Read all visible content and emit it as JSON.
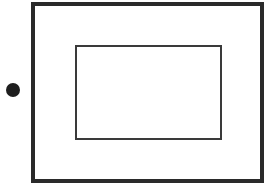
{
  "diagram": {
    "shapes": [
      {
        "type": "rectangle",
        "role": "outer-frame",
        "stroke": "thick",
        "color": "#2a2a2a"
      },
      {
        "type": "rectangle",
        "role": "inner-frame",
        "stroke": "thin",
        "color": "#3a3a3a"
      },
      {
        "type": "circle",
        "role": "marker-dot",
        "fill": "#1e1e1e"
      }
    ]
  }
}
